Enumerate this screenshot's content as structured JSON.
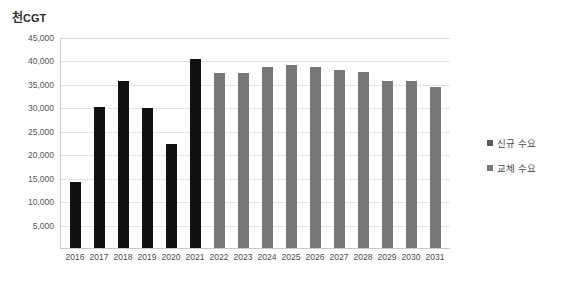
{
  "chart_data": {
    "type": "bar",
    "title": "천CGT",
    "title_prefix": "천",
    "title_unit": "CGT",
    "xlabel": "",
    "ylabel": "천CGT",
    "ylim": [
      0,
      45000
    ],
    "ytick_step": 5000,
    "grid": true,
    "legend_position": "right",
    "categories": [
      "2016",
      "2017",
      "2018",
      "2019",
      "2020",
      "2021",
      "2022",
      "2023",
      "2024",
      "2025",
      "2026",
      "2027",
      "2028",
      "2029",
      "2030",
      "2031"
    ],
    "ytick_labels": [
      "45,000",
      "40,000",
      "35,000",
      "30,000",
      "25,000",
      "20,000",
      "15,000",
      "10,000",
      "5,000"
    ],
    "ytick_values": [
      45000,
      40000,
      35000,
      30000,
      25000,
      20000,
      15000,
      10000,
      5000
    ],
    "series": [
      {
        "name": "신규 수요",
        "color": "#111111",
        "values": [
          14000,
          30000,
          35700,
          29800,
          22200,
          40300,
          null,
          null,
          null,
          null,
          null,
          null,
          null,
          null,
          null,
          null
        ]
      },
      {
        "name": "교체 수요",
        "color": "#787878",
        "values": [
          null,
          null,
          null,
          null,
          null,
          null,
          37400,
          37300,
          38700,
          39100,
          38700,
          38000,
          37600,
          35700,
          35600,
          34400
        ]
      }
    ],
    "bars": [
      {
        "category": "2016",
        "value": 14000,
        "series": "신규 수요",
        "color": "#111111"
      },
      {
        "category": "2017",
        "value": 30000,
        "series": "신규 수요",
        "color": "#111111"
      },
      {
        "category": "2018",
        "value": 35700,
        "series": "신규 수요",
        "color": "#111111"
      },
      {
        "category": "2019",
        "value": 29800,
        "series": "신규 수요",
        "color": "#111111"
      },
      {
        "category": "2020",
        "value": 22200,
        "series": "신규 수요",
        "color": "#111111"
      },
      {
        "category": "2021",
        "value": 40300,
        "series": "신규 수요",
        "color": "#111111"
      },
      {
        "category": "2022",
        "value": 37400,
        "series": "교체 수요",
        "color": "#787878"
      },
      {
        "category": "2023",
        "value": 37300,
        "series": "교체 수요",
        "color": "#787878"
      },
      {
        "category": "2024",
        "value": 38700,
        "series": "교체 수요",
        "color": "#787878"
      },
      {
        "category": "2025",
        "value": 39100,
        "series": "교체 수요",
        "color": "#787878"
      },
      {
        "category": "2026",
        "value": 38700,
        "series": "교체 수요",
        "color": "#787878"
      },
      {
        "category": "2027",
        "value": 38000,
        "series": "교체 수요",
        "color": "#787878"
      },
      {
        "category": "2028",
        "value": 37600,
        "series": "교체 수요",
        "color": "#787878"
      },
      {
        "category": "2029",
        "value": 35700,
        "series": "교체 수요",
        "color": "#787878"
      },
      {
        "category": "2030",
        "value": 35600,
        "series": "교체 수요",
        "color": "#787878"
      },
      {
        "category": "2031",
        "value": 34400,
        "series": "교체 수요",
        "color": "#787878"
      }
    ]
  },
  "legend": {
    "items": [
      {
        "label": "신규 수요",
        "color": "#5a5a5a"
      },
      {
        "label": "교체 수요",
        "color": "#787878"
      }
    ]
  }
}
